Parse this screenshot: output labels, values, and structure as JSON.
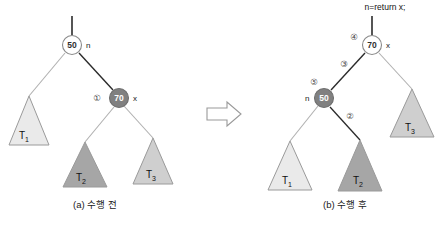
{
  "figure": {
    "background": "#ffffff",
    "arrow": {
      "name": "transform-arrow",
      "direction": "right"
    }
  },
  "colors": {
    "node_white_fill": "#ffffff",
    "node_dark_fill": "#808080",
    "node_stroke": "#8a8a8a",
    "triangle_light_fill": "#eaeaea",
    "triangle_mid_fill": "#cfcfcf",
    "triangle_dark_fill": "#a6a6a6",
    "triangle_stroke": "#9a9a9a",
    "edge_light": "#b0b0b0",
    "edge_dark": "#2b2b2b",
    "text": "#1a1a1a"
  },
  "before": {
    "caption": "(a) 수행 전",
    "root_stub_label": "",
    "nodes": [
      {
        "id": "n50",
        "value": "50",
        "style": "white",
        "pointer": "n"
      },
      {
        "id": "n70",
        "value": "70",
        "style": "dark",
        "pointer": "x",
        "step": "①"
      }
    ],
    "subtrees": [
      {
        "id": "T1",
        "label": "T",
        "sub": "1",
        "shade": "light"
      },
      {
        "id": "T2",
        "label": "T",
        "sub": "2",
        "shade": "dark"
      },
      {
        "id": "T3",
        "label": "T",
        "sub": "3",
        "shade": "mid"
      }
    ]
  },
  "after": {
    "caption": "(b) 수행 후",
    "code": "n=return x;",
    "nodes": [
      {
        "id": "n70",
        "value": "70",
        "style": "white",
        "pointer": "x",
        "step": "④"
      },
      {
        "id": "n50",
        "value": "50",
        "style": "dark",
        "pointer": "n",
        "step": "⑤"
      }
    ],
    "edge_steps": [
      {
        "id": "step3",
        "label": "③"
      },
      {
        "id": "step2",
        "label": "②"
      }
    ],
    "subtrees": [
      {
        "id": "T1",
        "label": "T",
        "sub": "1",
        "shade": "light"
      },
      {
        "id": "T2",
        "label": "T",
        "sub": "2",
        "shade": "dark"
      },
      {
        "id": "T3",
        "label": "T",
        "sub": "3",
        "shade": "mid"
      }
    ]
  }
}
